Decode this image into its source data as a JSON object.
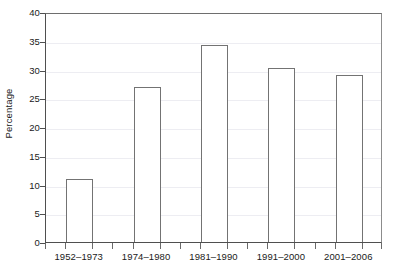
{
  "chart_data": {
    "type": "bar",
    "title": "",
    "xlabel": "",
    "ylabel": "Percentage",
    "categories": [
      "1952–1973",
      "1974–1980",
      "1981–1990",
      "1991–2000",
      "2001–2006"
    ],
    "values": [
      11.0,
      26.9,
      34.2,
      30.3,
      29.1
    ],
    "ylim": [
      0,
      40
    ],
    "ytick_values": [
      0,
      5,
      10,
      15,
      20,
      25,
      30,
      35,
      40
    ],
    "ytick_labels": [
      "0",
      "5",
      "10",
      "15",
      "20",
      "25",
      "30",
      "35",
      "40"
    ],
    "ytick_step": 5,
    "grid": "horizontal",
    "legend": "none",
    "bar_fill_color": "#ffffff",
    "bar_edge_color": "#737373",
    "gridline_color": "#ededf2",
    "axis_color": "#4f4f4f",
    "text_color": "#1a1a1a"
  },
  "axes": {
    "y_axis_label": "Percentage",
    "y_ticks": [
      {
        "label": "40",
        "value": 40
      },
      {
        "label": "35",
        "value": 35
      },
      {
        "label": "30",
        "value": 30
      },
      {
        "label": "25",
        "value": 25
      },
      {
        "label": "20",
        "value": 20
      },
      {
        "label": "15",
        "value": 15
      },
      {
        "label": "10",
        "value": 10
      },
      {
        "label": "5",
        "value": 5
      },
      {
        "label": "0",
        "value": 0
      }
    ],
    "x_ticks": [
      {
        "label": "1952–1973"
      },
      {
        "label": "1974–1980"
      },
      {
        "label": "1981–1990"
      },
      {
        "label": "1991–2000"
      },
      {
        "label": "2001–2006"
      }
    ]
  },
  "bars": [
    {
      "category": "1952–1973",
      "value": 11.0
    },
    {
      "category": "1974–1980",
      "value": 26.9
    },
    {
      "category": "1981–1990",
      "value": 34.2
    },
    {
      "category": "1991–2000",
      "value": 30.3
    },
    {
      "category": "2001–2006",
      "value": 29.1
    }
  ]
}
